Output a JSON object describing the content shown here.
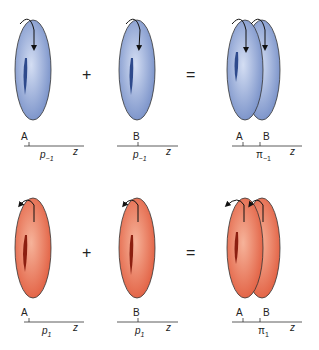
{
  "rows": [
    {
      "name": "p-minus-1 row",
      "color": "blue",
      "operators": [
        "+",
        "="
      ],
      "panels": [
        {
          "atom": "A",
          "orbital": "p",
          "sub": "−1",
          "axis": "z"
        },
        {
          "atom": "B",
          "orbital": "p",
          "sub": "−1",
          "axis": "z"
        },
        {
          "atoms": [
            "A",
            "B"
          ],
          "orbital": "π",
          "sub": "−1",
          "axis": "z"
        }
      ]
    },
    {
      "name": "p-plus-1 row",
      "color": "red",
      "operators": [
        "+",
        "="
      ],
      "panels": [
        {
          "atom": "A",
          "orbital": "p",
          "sub": "1",
          "axis": "z"
        },
        {
          "atom": "B",
          "orbital": "p",
          "sub": "1",
          "axis": "z"
        },
        {
          "atoms": [
            "A",
            "B"
          ],
          "orbital": "π",
          "sub": "1",
          "axis": "z"
        }
      ]
    }
  ],
  "colors": {
    "blue_light": "#c9d6ef",
    "blue_dark": "#6f89c4",
    "red_light": "#f4a486",
    "red_dark": "#e0583a"
  }
}
